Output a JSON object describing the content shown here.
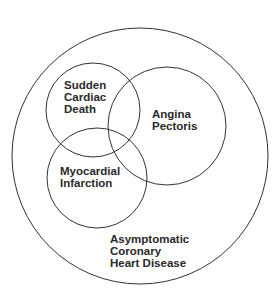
{
  "diagram": {
    "type": "venn",
    "stroke_color": "#333333",
    "background": "#ffffff",
    "circles": [
      {
        "id": "outer",
        "cx": 140,
        "cy": 156,
        "r": 128,
        "label": [
          "Asymptomatic",
          "Coronary",
          "Heart Disease"
        ]
      },
      {
        "id": "sudden-cardiac-death",
        "cx": 93,
        "cy": 110,
        "r": 47,
        "label": [
          "Sudden",
          "Cardiac",
          "Death"
        ]
      },
      {
        "id": "angina-pectoris",
        "cx": 167,
        "cy": 126,
        "r": 59,
        "label": [
          "Angina",
          "Pectoris"
        ]
      },
      {
        "id": "myocardial-infarction",
        "cx": 97,
        "cy": 178,
        "r": 50,
        "label": [
          "Myocardial",
          "Infarction"
        ]
      }
    ]
  },
  "labels": {
    "sudden": [
      "Sudden",
      "Cardiac",
      "Death"
    ],
    "angina": [
      "Angina",
      "Pectoris"
    ],
    "myocardial": [
      "Myocardial",
      "Infarction"
    ],
    "asymptomatic": [
      "Asymptomatic",
      "Coronary",
      "Heart Disease"
    ]
  }
}
